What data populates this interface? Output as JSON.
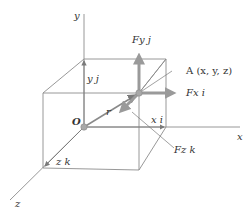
{
  "diagram": {
    "title_faint": "",
    "axes": {
      "x_label": "x",
      "y_label": "y",
      "z_label": "z",
      "origin_label": "O"
    },
    "point": {
      "label": "A (x, y, z)"
    },
    "position_vector": {
      "label": "r"
    },
    "components": {
      "x": "x i",
      "y": "y j",
      "z": "z k"
    },
    "forces": {
      "fx": "Fx i",
      "fy": "Fy j",
      "fz": "Fz k"
    },
    "colors": {
      "line": "#8c8c8c",
      "arrow": "#9a9a9a",
      "sphere": "#a8a8a8",
      "text": "#333333"
    }
  }
}
